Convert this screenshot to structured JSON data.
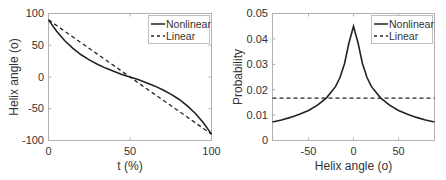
{
  "chart_data": [
    {
      "type": "line",
      "title": "",
      "xlabel": "t (%)",
      "ylabel": "Helix angle (o)",
      "xlim": [
        0,
        100
      ],
      "ylim": [
        -100,
        100
      ],
      "xticks": [
        0,
        50,
        100
      ],
      "yticks": [
        -100,
        -50,
        0,
        50,
        100
      ],
      "grid": false,
      "legend_position": "upper right",
      "x": [
        0,
        5,
        10,
        15,
        20,
        25,
        30,
        35,
        40,
        45,
        50,
        55,
        60,
        65,
        70,
        75,
        80,
        85,
        90,
        95,
        100
      ],
      "series": [
        {
          "name": "Nonlinear",
          "style": "solid",
          "values": [
            90,
            72,
            57,
            45,
            35,
            27,
            20,
            14,
            9,
            4,
            0,
            -4,
            -9,
            -14,
            -20,
            -27,
            -35,
            -45,
            -57,
            -72,
            -90
          ]
        },
        {
          "name": "Linear",
          "style": "dashed",
          "values": [
            90,
            81,
            72,
            63,
            54,
            45,
            36,
            27,
            18,
            9,
            0,
            -9,
            -18,
            -27,
            -36,
            -45,
            -54,
            -63,
            -72,
            -81,
            -90
          ]
        }
      ]
    },
    {
      "type": "line",
      "title": "",
      "xlabel": "Helix angle (o)",
      "ylabel": "Probability",
      "xlim": [
        -90,
        90
      ],
      "ylim": [
        0,
        0.05
      ],
      "xticks": [
        -50,
        0,
        50
      ],
      "yticks": [
        0,
        0.01,
        0.02,
        0.03,
        0.04,
        0.05
      ],
      "grid": false,
      "legend_position": "upper right",
      "x": [
        -90,
        -80,
        -70,
        -60,
        -50,
        -40,
        -30,
        -20,
        -15,
        -10,
        -5,
        0,
        5,
        10,
        15,
        20,
        30,
        40,
        50,
        60,
        70,
        80,
        90
      ],
      "series": [
        {
          "name": "Nonlinear",
          "style": "solid",
          "values": [
            0.0073,
            0.0081,
            0.0091,
            0.0103,
            0.0118,
            0.0139,
            0.0168,
            0.0212,
            0.0248,
            0.0302,
            0.0385,
            0.045,
            0.0385,
            0.0302,
            0.0248,
            0.0212,
            0.0168,
            0.0139,
            0.0118,
            0.0103,
            0.0091,
            0.0081,
            0.0073
          ]
        },
        {
          "name": "Linear",
          "style": "dashed",
          "values": [
            0.0167,
            0.0167,
            0.0167,
            0.0167,
            0.0167,
            0.0167,
            0.0167,
            0.0167,
            0.0167,
            0.0167,
            0.0167,
            0.0167,
            0.0167,
            0.0167,
            0.0167,
            0.0167,
            0.0167,
            0.0167,
            0.0167,
            0.0167,
            0.0167,
            0.0167,
            0.0167
          ]
        }
      ]
    }
  ],
  "left": {
    "xlabel": "t (%)",
    "ylabel": "Helix angle (o)",
    "xtick_labels": [
      "0",
      "50",
      "100"
    ],
    "ytick_labels": [
      "100",
      "50",
      "0",
      "-50",
      "-100"
    ],
    "legend": [
      "Nonlinear",
      "Linear"
    ]
  },
  "right": {
    "xlabel": "Helix angle (o)",
    "ylabel": "Probability",
    "xtick_labels": [
      "-50",
      "0",
      "50"
    ],
    "ytick_labels": [
      "0.05",
      "0.04",
      "0.03",
      "0.02",
      "0.01",
      "0"
    ],
    "legend": [
      "Nonlinear",
      "Linear"
    ]
  },
  "colors": {
    "line": "#222222",
    "axis": "#b0b0b0",
    "text": "#333333"
  }
}
